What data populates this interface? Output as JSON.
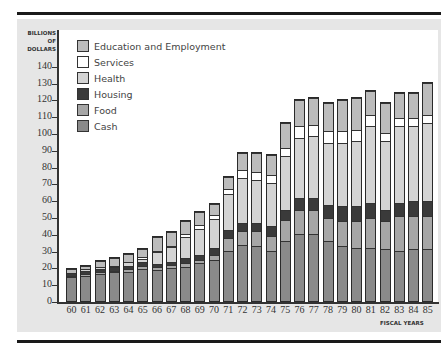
{
  "chart_data": {
    "type": "bar",
    "stacked": true,
    "title": "",
    "ylabel": "BILLIONS OF DOLLARS",
    "xlabel": "FISCAL YEARS",
    "ylim": [
      0,
      140
    ],
    "yticks": [
      0,
      10,
      20,
      30,
      40,
      50,
      60,
      70,
      80,
      90,
      100,
      110,
      120,
      130,
      140
    ],
    "grid": false,
    "legend_position": "upper-left",
    "categories": [
      "60",
      "61",
      "62",
      "63",
      "64",
      "65",
      "66",
      "67",
      "68",
      "69",
      "70",
      "71",
      "72",
      "73",
      "74",
      "75",
      "76",
      "77",
      "78",
      "79",
      "80",
      "81",
      "82",
      "83",
      "84",
      "85"
    ],
    "series": [
      {
        "name": "Cash",
        "color": "#8a8a8a",
        "values": [
          15,
          16,
          17,
          18,
          18,
          20,
          19,
          20,
          21,
          23,
          25,
          30,
          34,
          33,
          30,
          36,
          40,
          40,
          36,
          33,
          32,
          32,
          31,
          30,
          31,
          31
        ]
      },
      {
        "name": "Food",
        "color": "#a6a6a6",
        "values": [
          1,
          1,
          1,
          1,
          2,
          2,
          2,
          2,
          2,
          2,
          3,
          8,
          8,
          9,
          9,
          13,
          15,
          15,
          14,
          15,
          16,
          18,
          17,
          21,
          20,
          20
        ]
      },
      {
        "name": "Housing",
        "color": "#3a3a3a",
        "values": [
          2,
          2,
          2,
          2,
          2,
          2,
          2,
          2,
          3,
          3,
          4,
          5,
          5,
          5,
          6,
          6,
          7,
          7,
          8,
          9,
          9,
          9,
          7,
          8,
          9,
          9
        ]
      },
      {
        "name": "Health",
        "color": "#d4d4d4",
        "values": [
          0,
          1,
          1,
          1,
          2,
          2,
          7,
          9,
          13,
          16,
          18,
          22,
          27,
          26,
          26,
          32,
          36,
          37,
          37,
          38,
          39,
          46,
          41,
          46,
          45,
          47
        ]
      },
      {
        "name": "Services",
        "color": "#ffffff",
        "values": [
          0,
          0,
          0,
          0,
          0,
          1,
          1,
          1,
          2,
          2,
          2,
          3,
          5,
          5,
          5,
          5,
          7,
          7,
          7,
          7,
          7,
          7,
          5,
          5,
          5,
          5
        ]
      },
      {
        "name": "Education and Employment",
        "color": "#bcbcbc",
        "values": [
          2,
          2,
          4,
          5,
          5,
          5,
          8,
          8,
          8,
          8,
          7,
          7,
          10,
          11,
          12,
          15,
          16,
          16,
          17,
          19,
          19,
          14,
          18,
          15,
          15,
          19
        ]
      }
    ],
    "totals": [
      20,
      22,
      25,
      27,
      29,
      32,
      39,
      42,
      49,
      54,
      59,
      75,
      89,
      89,
      88,
      107,
      121,
      122,
      119,
      121,
      122,
      126,
      119,
      125,
      125,
      131
    ]
  },
  "legend": {
    "items": [
      {
        "label": "Education and Employment",
        "color": "#bcbcbc"
      },
      {
        "label": "Services",
        "color": "#ffffff"
      },
      {
        "label": "Health",
        "color": "#d4d4d4"
      },
      {
        "label": "Housing",
        "color": "#3a3a3a"
      },
      {
        "label": "Food",
        "color": "#a6a6a6"
      },
      {
        "label": "Cash",
        "color": "#8a8a8a"
      }
    ]
  },
  "axis": {
    "y_title_lines": [
      "BILLIONS",
      "OF",
      "DOLLARS"
    ],
    "x_title": "FISCAL YEARS"
  }
}
